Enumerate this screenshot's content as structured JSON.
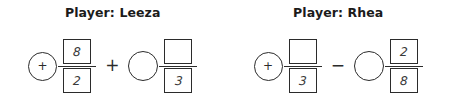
{
  "panels": [
    {
      "title": "Player: Leeza",
      "expression": {
        "lead_circle": {
          "icon": "plus-sign",
          "symbol": "+",
          "filled": true
        },
        "first_fraction": {
          "numerator": "8",
          "denominator": "2",
          "numerator_empty": false,
          "denominator_empty": false
        },
        "operator": {
          "icon": "plus-operator",
          "symbol": "+"
        },
        "second_circle": {
          "icon": "blank-circle",
          "symbol": "",
          "filled": false
        },
        "second_fraction": {
          "numerator": "",
          "denominator": "3",
          "numerator_empty": true,
          "denominator_empty": false
        }
      }
    },
    {
      "title": "Player: Rhea",
      "expression": {
        "lead_circle": {
          "icon": "plus-sign",
          "symbol": "+",
          "filled": true
        },
        "first_fraction": {
          "numerator": "",
          "denominator": "3",
          "numerator_empty": true,
          "denominator_empty": false
        },
        "operator": {
          "icon": "minus-operator",
          "symbol": "−"
        },
        "second_circle": {
          "icon": "blank-circle",
          "symbol": "",
          "filled": false
        },
        "second_fraction": {
          "numerator": "2",
          "denominator": "8",
          "numerator_empty": false,
          "denominator_empty": false
        }
      }
    }
  ],
  "colors": {
    "background": "#ffffff",
    "stroke": "#2b2b2b",
    "title_text": "#1b1b1b",
    "digit_text": "#3a3a3a"
  }
}
